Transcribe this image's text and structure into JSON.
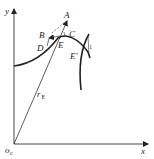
{
  "diagram": {
    "axes": {
      "x_label": "x",
      "y_label": "y",
      "origin_label": "o",
      "origin_subscript": "c"
    },
    "radius_label": {
      "main": "r",
      "subscript": "E"
    },
    "points": {
      "A": "A",
      "B": "B",
      "C": "C",
      "D": "D",
      "E": "E",
      "E_prime": "E'"
    },
    "marker": "1",
    "colors": {
      "ink": "#222222",
      "background": "#ffffff"
    }
  }
}
